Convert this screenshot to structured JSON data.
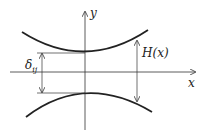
{
  "diagram": {
    "axes": {
      "x_label": "x",
      "y_label": "y"
    },
    "labels": {
      "gap_symbol": "δ",
      "gap_subscript": "ij",
      "height_function": "H(x)"
    },
    "elements": [
      "upper curve (concave up, vertex on y-axis)",
      "lower curve (concave down, vertex on y-axis)",
      "double arrow δij between vertices",
      "double arrow H(x) between curves at x"
    ],
    "colors": {
      "stroke": "#222222",
      "background": "#ffffff"
    }
  }
}
